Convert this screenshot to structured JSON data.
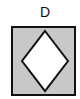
{
  "option": {
    "label": "D",
    "box": {
      "fill": "#c8c8c8",
      "stroke": "#111111"
    },
    "diamond": {
      "fill": "#ffffff",
      "stroke": "#111111"
    }
  }
}
